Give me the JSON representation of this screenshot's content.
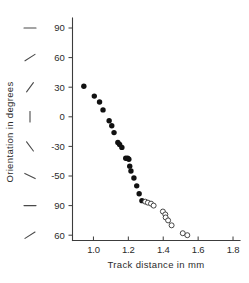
{
  "chart_data": {
    "type": "scatter",
    "title": "",
    "xlabel": "Track distance in mm",
    "ylabel": "Orientation in degrees",
    "xlim": [
      0.88,
      1.84
    ],
    "ylim": [
      0,
      7
    ],
    "grid": false,
    "legend_position": "none",
    "x_ticks": [
      {
        "value": 1.0,
        "label": "1.0"
      },
      {
        "value": 1.2,
        "label": "1.2"
      },
      {
        "value": 1.4,
        "label": "1.4"
      },
      {
        "value": 1.6,
        "label": "1.6"
      },
      {
        "value": 1.8,
        "label": "1.8"
      }
    ],
    "y_ticks": [
      {
        "slot": 0,
        "label": "90",
        "glyph": "horizontal"
      },
      {
        "slot": 1,
        "label": "60",
        "glyph": "slash-shallow"
      },
      {
        "slot": 2,
        "label": "30",
        "glyph": "slash-steep"
      },
      {
        "slot": 3,
        "label": "0",
        "glyph": "vertical"
      },
      {
        "slot": 4,
        "label": "-30",
        "glyph": "backslash-steep"
      },
      {
        "slot": 5,
        "label": "-50",
        "glyph": "backslash-shallow"
      },
      {
        "slot": 6,
        "label": "90",
        "glyph": "horizontal"
      },
      {
        "slot": 7,
        "label": "60",
        "glyph": "slash-shallow"
      }
    ],
    "series": [
      {
        "name": "filled-points",
        "marker": "filled-circle",
        "color": "#111111",
        "points": [
          {
            "x": 0.945,
            "y": 31
          },
          {
            "x": 1.005,
            "y": 21
          },
          {
            "x": 1.035,
            "y": 15
          },
          {
            "x": 1.055,
            "y": 7
          },
          {
            "x": 1.09,
            "y": -4
          },
          {
            "x": 1.105,
            "y": -9
          },
          {
            "x": 1.118,
            "y": -16
          },
          {
            "x": 1.14,
            "y": -26
          },
          {
            "x": 1.15,
            "y": -28
          },
          {
            "x": 1.163,
            "y": -31
          },
          {
            "x": 1.185,
            "y": -42
          },
          {
            "x": 1.196,
            "y": -42
          },
          {
            "x": 1.203,
            "y": -43
          },
          {
            "x": 1.208,
            "y": -50
          },
          {
            "x": 1.215,
            "y": -55
          },
          {
            "x": 1.232,
            "y": -62
          },
          {
            "x": 1.248,
            "y": -70
          },
          {
            "x": 1.262,
            "y": -78
          },
          {
            "x": 1.278,
            "y": -85
          }
        ]
      },
      {
        "name": "open-points",
        "marker": "open-circle",
        "color": "#333333",
        "points": [
          {
            "x": 1.297,
            "y": -86
          },
          {
            "x": 1.312,
            "y": -87
          },
          {
            "x": 1.33,
            "y": -88
          },
          {
            "x": 1.345,
            "y": -90
          },
          {
            "x": 1.398,
            "y": -96
          },
          {
            "x": 1.412,
            "y": -99
          },
          {
            "x": 1.414,
            "y": -102
          },
          {
            "x": 1.428,
            "y": -105
          },
          {
            "x": 1.448,
            "y": -110
          },
          {
            "x": 1.512,
            "y": -118
          },
          {
            "x": 1.538,
            "y": -120
          }
        ]
      }
    ]
  },
  "colors": {
    "axis": "#3c3c3c",
    "text": "#2b2b2b",
    "filled_marker": "#111111",
    "open_marker": "#333333",
    "background": "#ffffff"
  }
}
